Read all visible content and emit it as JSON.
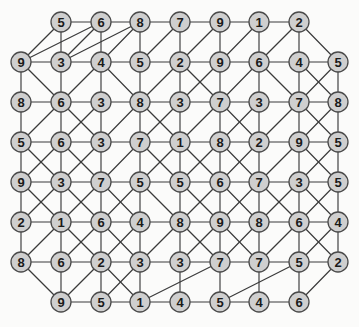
{
  "figure": {
    "kind": "node-link-graph",
    "background_color": "#fbfbfa",
    "node_fill": "#cfcfcf",
    "node_stroke": "#4a4a4a",
    "edge_color": "#3a3a3a",
    "label_color": "#1a1a1a",
    "node_radius": 10,
    "width": 359,
    "height": 327
  },
  "chart_data": {
    "type": "table",
    "title": "",
    "xlabel": "",
    "ylabel": "",
    "rows": [
      {
        "row": 1,
        "y": 22,
        "xs": [
          61,
          101,
          140,
          180,
          220,
          259,
          299
        ],
        "values": [
          5,
          6,
          8,
          7,
          9,
          1,
          2
        ]
      },
      {
        "row": 2,
        "y": 62,
        "xs": [
          21,
          61,
          101,
          140,
          180,
          220,
          259,
          299,
          338
        ],
        "values": [
          9,
          3,
          4,
          5,
          2,
          9,
          6,
          4,
          5
        ]
      },
      {
        "row": 3,
        "y": 102,
        "xs": [
          21,
          61,
          101,
          140,
          180,
          220,
          259,
          299,
          338
        ],
        "values": [
          8,
          6,
          3,
          8,
          3,
          7,
          3,
          7,
          8
        ]
      },
      {
        "row": 4,
        "y": 142,
        "xs": [
          21,
          61,
          101,
          140,
          180,
          220,
          259,
          299,
          338
        ],
        "values": [
          5,
          6,
          3,
          7,
          1,
          8,
          2,
          9,
          5
        ]
      },
      {
        "row": 5,
        "y": 182,
        "xs": [
          21,
          61,
          101,
          140,
          180,
          220,
          259,
          299,
          338
        ],
        "values": [
          9,
          3,
          7,
          5,
          5,
          6,
          7,
          3,
          5
        ]
      },
      {
        "row": 6,
        "y": 222,
        "xs": [
          21,
          61,
          101,
          140,
          180,
          220,
          259,
          299,
          338
        ],
        "values": [
          2,
          1,
          6,
          4,
          8,
          9,
          8,
          6,
          4
        ]
      },
      {
        "row": 7,
        "y": 262,
        "xs": [
          21,
          61,
          101,
          140,
          180,
          220,
          259,
          299,
          338
        ],
        "values": [
          8,
          6,
          2,
          3,
          3,
          7,
          7,
          5,
          2
        ]
      },
      {
        "row": 8,
        "y": 302,
        "xs": [
          61,
          101,
          140,
          180,
          220,
          259,
          299
        ],
        "values": [
          9,
          5,
          1,
          4,
          5,
          4,
          6
        ]
      }
    ],
    "node_count": 68,
    "all_values": [
      5,
      6,
      8,
      7,
      9,
      1,
      2,
      9,
      3,
      4,
      5,
      2,
      9,
      6,
      4,
      5,
      8,
      6,
      3,
      8,
      3,
      7,
      3,
      7,
      8,
      5,
      6,
      3,
      7,
      1,
      8,
      2,
      9,
      5,
      9,
      3,
      7,
      5,
      5,
      6,
      7,
      3,
      5,
      2,
      1,
      6,
      4,
      8,
      9,
      8,
      6,
      4,
      8,
      6,
      2,
      3,
      3,
      7,
      7,
      5,
      2,
      9,
      5,
      1,
      4,
      5,
      4,
      6
    ],
    "edges": [
      [
        1,
        0,
        1,
        1
      ],
      [
        1,
        1,
        1,
        2
      ],
      [
        1,
        2,
        1,
        3
      ],
      [
        1,
        3,
        1,
        4
      ],
      [
        1,
        4,
        1,
        5
      ],
      [
        1,
        5,
        1,
        6
      ],
      [
        2,
        0,
        2,
        1
      ],
      [
        2,
        1,
        2,
        2
      ],
      [
        2,
        2,
        2,
        3
      ],
      [
        2,
        3,
        2,
        4
      ],
      [
        2,
        4,
        2,
        5
      ],
      [
        2,
        5,
        2,
        6
      ],
      [
        2,
        6,
        2,
        7
      ],
      [
        2,
        7,
        2,
        8
      ],
      [
        3,
        0,
        3,
        1
      ],
      [
        3,
        1,
        3,
        2
      ],
      [
        3,
        2,
        3,
        3
      ],
      [
        3,
        3,
        3,
        4
      ],
      [
        3,
        4,
        3,
        5
      ],
      [
        3,
        5,
        3,
        6
      ],
      [
        3,
        6,
        3,
        7
      ],
      [
        3,
        7,
        3,
        8
      ],
      [
        4,
        0,
        4,
        1
      ],
      [
        4,
        1,
        4,
        2
      ],
      [
        4,
        2,
        4,
        3
      ],
      [
        4,
        3,
        4,
        4
      ],
      [
        4,
        4,
        4,
        5
      ],
      [
        4,
        5,
        4,
        6
      ],
      [
        4,
        6,
        4,
        7
      ],
      [
        4,
        7,
        4,
        8
      ],
      [
        5,
        0,
        5,
        1
      ],
      [
        5,
        1,
        5,
        2
      ],
      [
        5,
        2,
        5,
        3
      ],
      [
        5,
        3,
        5,
        4
      ],
      [
        5,
        4,
        5,
        5
      ],
      [
        5,
        5,
        5,
        6
      ],
      [
        5,
        6,
        5,
        7
      ],
      [
        5,
        7,
        5,
        8
      ],
      [
        6,
        0,
        6,
        1
      ],
      [
        6,
        1,
        6,
        2
      ],
      [
        6,
        2,
        6,
        3
      ],
      [
        6,
        3,
        6,
        4
      ],
      [
        6,
        4,
        6,
        5
      ],
      [
        6,
        5,
        6,
        6
      ],
      [
        6,
        6,
        6,
        7
      ],
      [
        6,
        7,
        6,
        8
      ],
      [
        7,
        0,
        7,
        1
      ],
      [
        7,
        1,
        7,
        2
      ],
      [
        7,
        2,
        7,
        3
      ],
      [
        7,
        3,
        7,
        4
      ],
      [
        7,
        4,
        7,
        5
      ],
      [
        7,
        5,
        7,
        6
      ],
      [
        7,
        6,
        7,
        7
      ],
      [
        7,
        7,
        7,
        8
      ],
      [
        8,
        0,
        8,
        1
      ],
      [
        8,
        1,
        8,
        2
      ],
      [
        8,
        2,
        8,
        3
      ],
      [
        8,
        3,
        8,
        4
      ],
      [
        8,
        4,
        8,
        5
      ],
      [
        8,
        5,
        8,
        6
      ],
      [
        1,
        0,
        2,
        1
      ],
      [
        1,
        1,
        2,
        2
      ],
      [
        1,
        2,
        2,
        3
      ],
      [
        1,
        3,
        2,
        4
      ],
      [
        1,
        4,
        2,
        5
      ],
      [
        1,
        5,
        2,
        6
      ],
      [
        1,
        6,
        2,
        7
      ],
      [
        2,
        0,
        3,
        0
      ],
      [
        2,
        1,
        3,
        1
      ],
      [
        2,
        2,
        3,
        2
      ],
      [
        2,
        3,
        3,
        3
      ],
      [
        2,
        4,
        3,
        4
      ],
      [
        2,
        5,
        3,
        5
      ],
      [
        2,
        6,
        3,
        6
      ],
      [
        2,
        7,
        3,
        7
      ],
      [
        2,
        8,
        3,
        8
      ],
      [
        3,
        0,
        4,
        0
      ],
      [
        3,
        1,
        4,
        1
      ],
      [
        3,
        2,
        4,
        2
      ],
      [
        3,
        3,
        4,
        3
      ],
      [
        3,
        4,
        4,
        4
      ],
      [
        3,
        5,
        4,
        5
      ],
      [
        3,
        6,
        4,
        6
      ],
      [
        3,
        7,
        4,
        7
      ],
      [
        3,
        8,
        4,
        8
      ],
      [
        4,
        0,
        5,
        0
      ],
      [
        4,
        1,
        5,
        1
      ],
      [
        4,
        2,
        5,
        2
      ],
      [
        4,
        3,
        5,
        3
      ],
      [
        4,
        4,
        5,
        4
      ],
      [
        4,
        5,
        5,
        5
      ],
      [
        4,
        6,
        5,
        6
      ],
      [
        4,
        7,
        5,
        7
      ],
      [
        4,
        8,
        5,
        8
      ],
      [
        5,
        0,
        6,
        0
      ],
      [
        5,
        1,
        6,
        1
      ],
      [
        5,
        2,
        6,
        2
      ],
      [
        5,
        3,
        6,
        3
      ],
      [
        5,
        4,
        6,
        4
      ],
      [
        5,
        5,
        6,
        5
      ],
      [
        5,
        6,
        6,
        6
      ],
      [
        5,
        7,
        6,
        7
      ],
      [
        5,
        8,
        6,
        8
      ],
      [
        6,
        0,
        7,
        0
      ],
      [
        6,
        1,
        7,
        1
      ],
      [
        6,
        2,
        7,
        2
      ],
      [
        6,
        3,
        7,
        3
      ],
      [
        6,
        4,
        7,
        4
      ],
      [
        6,
        5,
        7,
        5
      ],
      [
        6,
        6,
        7,
        6
      ],
      [
        6,
        7,
        7,
        7
      ],
      [
        6,
        8,
        7,
        8
      ],
      [
        7,
        1,
        8,
        0
      ],
      [
        7,
        2,
        8,
        1
      ],
      [
        7,
        3,
        8,
        2
      ],
      [
        7,
        4,
        8,
        3
      ],
      [
        7,
        5,
        8,
        4
      ],
      [
        7,
        6,
        8,
        5
      ],
      [
        7,
        7,
        8,
        6
      ],
      [
        1,
        0,
        2,
        0
      ],
      [
        1,
        1,
        2,
        0
      ],
      [
        1,
        1,
        2,
        1
      ],
      [
        1,
        2,
        2,
        2
      ],
      [
        1,
        2,
        2,
        1
      ],
      [
        1,
        3,
        2,
        3
      ],
      [
        1,
        4,
        2,
        4
      ],
      [
        1,
        4,
        2,
        4
      ],
      [
        1,
        5,
        2,
        5
      ],
      [
        1,
        5,
        2,
        6
      ],
      [
        1,
        6,
        2,
        6
      ],
      [
        1,
        6,
        2,
        8
      ],
      [
        2,
        0,
        3,
        1
      ],
      [
        2,
        2,
        3,
        1
      ],
      [
        2,
        2,
        3,
        3
      ],
      [
        2,
        4,
        3,
        3
      ],
      [
        2,
        4,
        3,
        5
      ],
      [
        2,
        5,
        3,
        4
      ],
      [
        2,
        6,
        3,
        5
      ],
      [
        2,
        6,
        3,
        7
      ],
      [
        2,
        7,
        3,
        8
      ],
      [
        2,
        8,
        3,
        7
      ],
      [
        3,
        1,
        4,
        0
      ],
      [
        3,
        1,
        4,
        2
      ],
      [
        3,
        2,
        4,
        1
      ],
      [
        3,
        3,
        4,
        2
      ],
      [
        3,
        3,
        4,
        4
      ],
      [
        3,
        4,
        4,
        3
      ],
      [
        3,
        5,
        4,
        4
      ],
      [
        3,
        5,
        4,
        6
      ],
      [
        3,
        6,
        4,
        5
      ],
      [
        3,
        7,
        4,
        6
      ],
      [
        3,
        7,
        4,
        8
      ],
      [
        3,
        8,
        4,
        7
      ],
      [
        4,
        0,
        5,
        1
      ],
      [
        4,
        1,
        5,
        0
      ],
      [
        4,
        1,
        5,
        2
      ],
      [
        4,
        2,
        5,
        1
      ],
      [
        4,
        3,
        5,
        2
      ],
      [
        4,
        3,
        5,
        4
      ],
      [
        4,
        4,
        5,
        3
      ],
      [
        4,
        4,
        5,
        5
      ],
      [
        4,
        5,
        5,
        4
      ],
      [
        4,
        5,
        5,
        6
      ],
      [
        4,
        6,
        5,
        5
      ],
      [
        4,
        7,
        5,
        6
      ],
      [
        4,
        7,
        5,
        8
      ],
      [
        4,
        8,
        5,
        7
      ],
      [
        5,
        0,
        6,
        1
      ],
      [
        5,
        1,
        6,
        0
      ],
      [
        5,
        1,
        6,
        2
      ],
      [
        5,
        2,
        6,
        1
      ],
      [
        5,
        2,
        6,
        3
      ],
      [
        5,
        3,
        6,
        2
      ],
      [
        5,
        3,
        6,
        4
      ],
      [
        5,
        4,
        6,
        5
      ],
      [
        5,
        5,
        6,
        4
      ],
      [
        5,
        5,
        6,
        6
      ],
      [
        5,
        6,
        6,
        5
      ],
      [
        5,
        6,
        6,
        7
      ],
      [
        5,
        7,
        6,
        6
      ],
      [
        5,
        7,
        6,
        8
      ],
      [
        5,
        8,
        6,
        7
      ],
      [
        6,
        1,
        7,
        0
      ],
      [
        6,
        1,
        7,
        2
      ],
      [
        6,
        2,
        7,
        1
      ],
      [
        6,
        2,
        7,
        3
      ],
      [
        6,
        3,
        7,
        2
      ],
      [
        6,
        4,
        7,
        3
      ],
      [
        6,
        4,
        7,
        5
      ],
      [
        6,
        5,
        7,
        4
      ],
      [
        6,
        5,
        7,
        6
      ],
      [
        6,
        6,
        7,
        5
      ],
      [
        6,
        7,
        7,
        6
      ],
      [
        6,
        7,
        7,
        8
      ],
      [
        6,
        8,
        7,
        7
      ],
      [
        7,
        0,
        8,
        0
      ],
      [
        7,
        2,
        8,
        0
      ],
      [
        7,
        2,
        8,
        2
      ],
      [
        7,
        3,
        8,
        1
      ],
      [
        7,
        4,
        8,
        3
      ],
      [
        7,
        5,
        8,
        2
      ],
      [
        7,
        5,
        8,
        4
      ],
      [
        7,
        6,
        8,
        5
      ],
      [
        7,
        7,
        8,
        4
      ],
      [
        7,
        8,
        8,
        6
      ]
    ],
    "legend": [],
    "annotations": []
  }
}
